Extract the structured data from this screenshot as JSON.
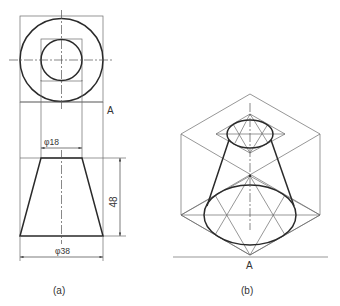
{
  "figure": {
    "view_a": {
      "caption": "(a)",
      "point_label": "A",
      "dim_top_diameter": "φ18",
      "dim_bottom_diameter": "φ38",
      "dim_height": "48"
    },
    "view_b": {
      "caption": "(b)",
      "point_label": "A"
    }
  },
  "colors": {
    "line": "#2a2a2a",
    "construction": "#6a6a6a",
    "background": "#ffffff"
  }
}
